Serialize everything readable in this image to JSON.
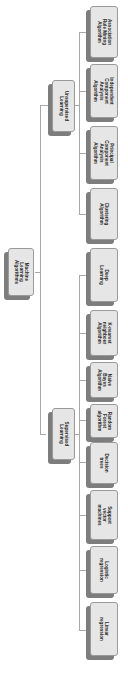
{
  "diagram": {
    "type": "tree",
    "orientation": "rotated-90-clockwise",
    "root": {
      "label": "Machine\nLearning\nAlgorithms"
    },
    "branches": [
      {
        "label": "Unsupervised\nLearning",
        "children": [
          {
            "label": "Association\nRule Mining\nAlgorithm"
          },
          {
            "label": "Independent\nComponent\nAnalysis\nAlgorithm"
          },
          {
            "label": "Principal\nComponent\nAnalysis\nAlgorithm"
          },
          {
            "label": "Clustering\nAlgorithm"
          }
        ]
      },
      {
        "label": "Supervised\nLearning",
        "children": [
          {
            "label": "Deep Learning"
          },
          {
            "label": "K-nearest\nneighbour\nAlgorithm"
          },
          {
            "label": "Naïve Bayes\nAlgorithm"
          },
          {
            "label": "Random Forest\nalgorithm"
          },
          {
            "label": "Decision trees"
          },
          {
            "label": "Support vector\nmachines"
          },
          {
            "label": "Logistic\nregression"
          },
          {
            "label": "Linear\nregression"
          }
        ]
      }
    ],
    "colors": {
      "box_fill": "#e6e6e6",
      "box_shadow": "#7d7d7d",
      "connector": "#a8a8a8",
      "text": "#2a2a2a"
    }
  }
}
